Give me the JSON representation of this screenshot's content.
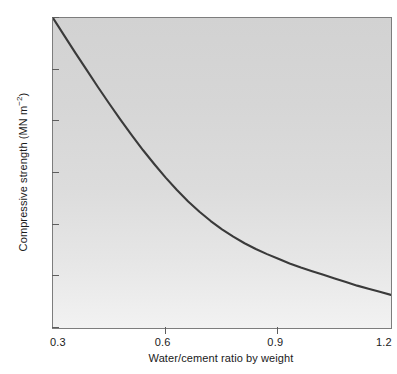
{
  "chart_data": {
    "type": "line",
    "title": "",
    "xlabel": "Water/cement ratio by weight",
    "ylabel_text": "Compressive strength (MN m",
    "ylabel_sup": "−2",
    "ylabel_tail": ")",
    "ylabel_full": "Compressive strength (MN m⁻²)",
    "xlim": [
      0.3,
      1.2
    ],
    "ylim": [
      0,
      60
    ],
    "xticks": [
      0.3,
      0.6,
      0.9,
      1.2
    ],
    "xticklabels": [
      "0.3",
      "0.6",
      "0.9",
      "1.2"
    ],
    "yticks": [
      0,
      10,
      20,
      30,
      40,
      50,
      60
    ],
    "yticklabels": [
      "0",
      "10",
      "20",
      "30",
      "40",
      "50",
      "60"
    ],
    "grid": false,
    "legend": null,
    "series": [
      {
        "name": "Compressive strength vs water/cement ratio",
        "color": "#3a3a3a",
        "x": [
          0.3,
          0.33,
          0.36,
          0.39,
          0.42,
          0.45,
          0.48,
          0.51,
          0.54,
          0.57,
          0.6,
          0.63,
          0.66,
          0.69,
          0.72,
          0.75,
          0.78,
          0.81,
          0.84,
          0.87,
          0.9,
          0.93,
          0.96,
          0.99,
          1.02,
          1.05,
          1.08,
          1.11,
          1.14,
          1.17,
          1.2
        ],
        "y": [
          60.0,
          56.6,
          53.2,
          49.9,
          46.6,
          43.4,
          40.3,
          37.3,
          34.4,
          31.7,
          29.1,
          26.7,
          24.5,
          22.5,
          20.7,
          19.1,
          17.7,
          16.4,
          15.3,
          14.3,
          13.4,
          12.5,
          11.7,
          11.0,
          10.3,
          9.6,
          8.9,
          8.2,
          7.6,
          7.0,
          6.4
        ]
      }
    ]
  },
  "axes": {
    "frame_color": "#7d7d7d",
    "plot_bg_top": "#d2d2d2",
    "plot_bg_bottom": "#f2f2f2",
    "tick_color": "#5e5e5e",
    "text_color": "#1a1a1a"
  }
}
